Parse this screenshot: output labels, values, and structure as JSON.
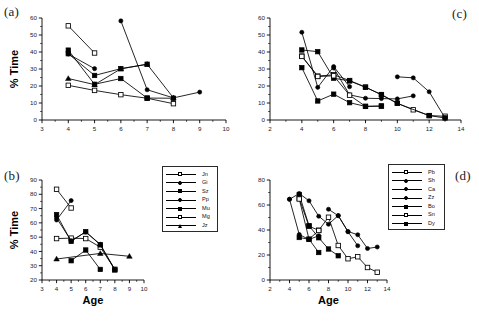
{
  "figure": {
    "panels": [
      "(a)",
      "(b)",
      "(c)",
      "(d)"
    ],
    "axis_title_x": "Age",
    "axis_title_y": "% Time",
    "marker_colors": {
      "fill_closed": "#000000",
      "fill_open": "#ffffff",
      "line": "#000000"
    }
  },
  "panel_a": {
    "label": "(a)",
    "xlabel": "",
    "ylabel": "% Time",
    "xticks": [
      "3",
      "4",
      "5",
      "6",
      "7",
      "8",
      "9",
      "10"
    ],
    "yticks": [
      "0",
      "10",
      "20",
      "30",
      "40",
      "50",
      "60"
    ]
  },
  "panel_b": {
    "label": "(b)",
    "xlabel": "Age",
    "ylabel": "% Time",
    "xticks": [
      "3",
      "4",
      "5",
      "6",
      "7",
      "8",
      "9",
      "10"
    ],
    "yticks": [
      "20",
      "30",
      "40",
      "50",
      "60",
      "70",
      "80",
      "90"
    ]
  },
  "panel_c": {
    "label": "(c)",
    "xlabel": "",
    "ylabel": "",
    "xticks": [
      "2",
      "4",
      "6",
      "8",
      "10",
      "12",
      "14"
    ],
    "yticks": [
      "0",
      "10",
      "20",
      "30",
      "40",
      "50",
      "60"
    ]
  },
  "panel_d": {
    "label": "(d)",
    "xlabel": "Age",
    "ylabel": "",
    "xticks": [
      "2",
      "4",
      "6",
      "8",
      "10",
      "12",
      "14"
    ],
    "yticks": [
      "0",
      "20",
      "40",
      "60",
      "80"
    ]
  },
  "legend_left": {
    "entries": [
      {
        "label": "Jn",
        "marker": "open-square"
      },
      {
        "label": "Gi",
        "marker": "closed-circle"
      },
      {
        "label": "Sz",
        "marker": "closed-square"
      },
      {
        "label": "Pp",
        "marker": "closed-circle"
      },
      {
        "label": "Mu",
        "marker": "closed-square"
      },
      {
        "label": "Mg",
        "marker": "open-square"
      },
      {
        "label": "Jz",
        "marker": "closed-triangle"
      }
    ]
  },
  "legend_right": {
    "entries": [
      {
        "label": "Pb",
        "marker": "open-square"
      },
      {
        "label": "Sh",
        "marker": "closed-circle"
      },
      {
        "label": "Ca",
        "marker": "closed-circle"
      },
      {
        "label": "Zz",
        "marker": "closed-circle"
      },
      {
        "label": "Bo",
        "marker": "closed-square"
      },
      {
        "label": "Sn",
        "marker": "open-square"
      },
      {
        "label": "Dy",
        "marker": "closed-square"
      }
    ]
  },
  "chart_data": [
    {
      "type": "line",
      "panel": "(a)",
      "title": "",
      "xlabel": "Age",
      "ylabel": "% Time",
      "xlim": [
        3,
        10
      ],
      "ylim": [
        0,
        60
      ],
      "grid": false,
      "legend": "legend_left",
      "series": [
        {
          "name": "Jn",
          "marker": "open-square",
          "x": [
            4,
            5,
            6,
            7,
            8
          ],
          "y": [
            20.4,
            17.4,
            14.9,
            12.8,
            9.6
          ]
        },
        {
          "name": "Gi",
          "marker": "closed-circle",
          "x": [
            6,
            7,
            8,
            9
          ],
          "y": [
            58.3,
            17.8,
            13.0,
            16.4
          ]
        },
        {
          "name": "Sz",
          "marker": "closed-square",
          "x": [
            4,
            5,
            6,
            7,
            8
          ],
          "y": [
            41.1,
            21.0,
            24.4,
            12.9,
            12.8
          ]
        },
        {
          "name": "Pp",
          "marker": "closed-circle",
          "x": [
            4,
            5
          ],
          "y": [
            38.8,
            30.2
          ]
        },
        {
          "name": "Mu",
          "marker": "closed-square",
          "x": [
            4,
            5,
            6,
            7
          ],
          "y": [
            39.0,
            26.2,
            30.2,
            32.8
          ]
        },
        {
          "name": "Mg",
          "marker": "open-square",
          "x": [
            4,
            5
          ],
          "y": [
            55.4,
            39.4
          ]
        },
        {
          "name": "Jz",
          "marker": "closed-triangle",
          "x": [
            4,
            5,
            6,
            7,
            8
          ],
          "y": [
            24.4,
            20.8,
            30.1,
            32.8,
            13.0
          ]
        }
      ]
    },
    {
      "type": "line",
      "panel": "(b)",
      "title": "",
      "xlabel": "Age",
      "ylabel": "% Time",
      "xlim": [
        3,
        10
      ],
      "ylim": [
        20,
        90
      ],
      "grid": false,
      "legend": "legend_left",
      "series": [
        {
          "name": "Jn",
          "marker": "open-square",
          "x": [
            4,
            5,
            6,
            7,
            8
          ],
          "y": [
            49.0,
            49.3,
            49.0,
            43.0,
            27.5
          ]
        },
        {
          "name": "Gi",
          "marker": "closed-circle",
          "x": [
            4,
            5
          ],
          "y": [
            62.0,
            75.6
          ]
        },
        {
          "name": "Sz",
          "marker": "closed-square",
          "x": [
            4,
            5,
            6,
            7,
            8
          ],
          "y": [
            65.8,
            47.0,
            53.8,
            44.6,
            27.0
          ]
        },
        {
          "name": "Pp",
          "marker": "closed-circle",
          "x": [
            4,
            5,
            6,
            7,
            8
          ],
          "y": [
            63.4,
            47.5,
            53.6,
            45.0,
            27.3
          ]
        },
        {
          "name": "Mu",
          "marker": "closed-square",
          "x": [
            5,
            6,
            7
          ],
          "y": [
            33.5,
            41.0,
            27.4
          ]
        },
        {
          "name": "Mg",
          "marker": "open-square",
          "x": [
            4,
            5
          ],
          "y": [
            83.5,
            70.4
          ]
        },
        {
          "name": "Jz",
          "marker": "closed-triangle",
          "x": [
            4,
            7,
            9
          ],
          "y": [
            34.7,
            38.6,
            36.6
          ]
        }
      ]
    },
    {
      "type": "line",
      "panel": "(c)",
      "title": "",
      "xlabel": "Age",
      "ylabel": "% Time",
      "xlim": [
        2,
        14
      ],
      "ylim": [
        0,
        60
      ],
      "grid": false,
      "legend": "legend_right",
      "series": [
        {
          "name": "Pb",
          "marker": "open-square",
          "x": [
            4,
            5,
            6,
            7,
            8,
            9,
            10,
            11,
            12,
            13
          ],
          "y": [
            37.6,
            25.8,
            26.6,
            23.2,
            19.4,
            14.8,
            9.8,
            6.0,
            2.6,
            2.2
          ]
        },
        {
          "name": "Sh",
          "marker": "closed-circle",
          "x": [
            10,
            11,
            12,
            13
          ],
          "y": [
            25.4,
            24.8,
            16.6,
            1.2
          ]
        },
        {
          "name": "Ca",
          "marker": "closed-circle",
          "x": [
            4,
            5,
            6,
            7
          ],
          "y": [
            51.6,
            19.2,
            31.4,
            19.6
          ]
        },
        {
          "name": "Zz",
          "marker": "closed-circle",
          "x": [
            6,
            7,
            8,
            9,
            10,
            11
          ],
          "y": [
            30.6,
            14.8,
            12.8,
            12.6,
            12.4,
            14.2
          ]
        },
        {
          "name": "Bo",
          "marker": "closed-square",
          "x": [
            4,
            5,
            6,
            7,
            8,
            9,
            10,
            12,
            13
          ],
          "y": [
            41.2,
            40.2,
            24.6,
            23.0,
            19.2,
            15.0,
            9.8,
            2.6,
            1.2
          ]
        },
        {
          "name": "Sn",
          "marker": "open-square",
          "x": [
            4,
            5,
            6,
            7,
            8,
            9
          ],
          "y": [
            37.4,
            25.6,
            26.0,
            14.6,
            8.0,
            8.2
          ]
        },
        {
          "name": "Dy",
          "marker": "closed-square",
          "x": [
            4,
            5,
            6,
            7,
            8,
            9
          ],
          "y": [
            30.8,
            11.2,
            15.2,
            10.2,
            8.0,
            8.2
          ]
        }
      ]
    },
    {
      "type": "line",
      "panel": "(d)",
      "title": "",
      "xlabel": "Age",
      "ylabel": "% Time",
      "xlim": [
        2,
        14
      ],
      "ylim": [
        0,
        80
      ],
      "grid": false,
      "legend": "legend_right",
      "series": [
        {
          "name": "Pb",
          "marker": "open-square",
          "x": [
            5,
            6,
            7,
            8,
            9,
            10,
            11,
            12,
            13
          ],
          "y": [
            65.2,
            43.0,
            39.8,
            50.2,
            27.6,
            17.0,
            18.6,
            10.0,
            6.2
          ]
        },
        {
          "name": "Sh",
          "marker": "closed-circle",
          "x": [
            4,
            5,
            6,
            7,
            8,
            9,
            10,
            11
          ],
          "y": [
            64.6,
            69.2,
            63.4,
            51.0,
            44.6,
            51.6,
            38.6,
            27.4
          ]
        },
        {
          "name": "Ca",
          "marker": "closed-circle",
          "x": [
            8,
            9,
            10,
            11,
            12,
            13
          ],
          "y": [
            56.6,
            51.4,
            38.8,
            36.2,
            25.2,
            26.4
          ]
        },
        {
          "name": "Zz",
          "marker": "closed-circle",
          "x": [
            4,
            5,
            6,
            7
          ],
          "y": [
            64.6,
            36.4,
            32.4,
            35.4
          ]
        },
        {
          "name": "Bo",
          "marker": "closed-square",
          "x": [
            5,
            6,
            7,
            8,
            9
          ],
          "y": [
            68.4,
            43.4,
            33.8,
            24.8,
            19.4
          ]
        },
        {
          "name": "Sn",
          "marker": "open-square",
          "x": [
            5,
            6,
            7
          ],
          "y": [
            64.8,
            32.6,
            39.6
          ]
        },
        {
          "name": "Dy",
          "marker": "closed-square",
          "x": [
            5,
            6,
            7
          ],
          "y": [
            34.0,
            32.6,
            22.0
          ]
        }
      ]
    }
  ]
}
